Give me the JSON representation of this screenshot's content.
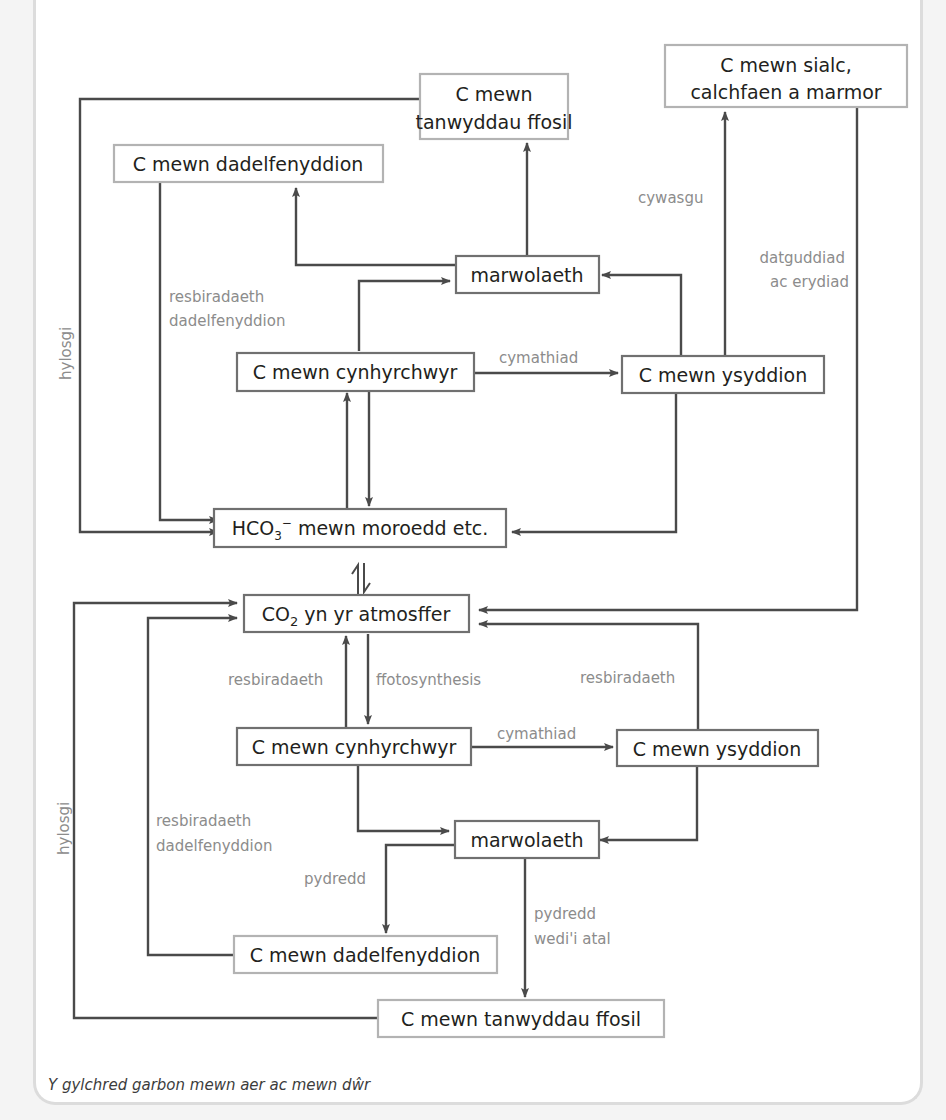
{
  "caption": "Y gylchred garbon mewn aer ac mewn dŵr",
  "colors": {
    "line": "#4a4a4a",
    "box_text": "#231f20",
    "label": "#8c8c8c",
    "grey_border": "#b3b3b3",
    "dark_border": "#707070"
  },
  "top": {
    "boxes": {
      "fossil_fuels_l1": "C mewn",
      "fossil_fuels_l2": "tanwyddau ffosil",
      "chalk_l1": "C mewn sialc,",
      "chalk_l2": "calchfaen a marmor",
      "decomposers": "C mewn dadelfenyddion",
      "death": "marwolaeth",
      "producers": "C mewn cynhyrchwyr",
      "consumers": "C mewn ysyddion",
      "bicarbonate_prefix": "HCO",
      "bicarbonate_sub": "3",
      "bicarbonate_sup": "−",
      "bicarbonate_rest": " mewn moroedd etc."
    },
    "labels": {
      "combustion": "hylosgi",
      "decomp_resp_l1": "resbiradaeth",
      "decomp_resp_l2": "dadelfenyddion",
      "compression": "cywasgu",
      "exposure_l1": "datguddiad",
      "exposure_l2": "ac erydiad",
      "assimilation": "cymathiad"
    }
  },
  "bottom": {
    "boxes": {
      "atmosphere_prefix": "CO",
      "atmosphere_sub": "2",
      "atmosphere_rest": " yn yr atmosffer",
      "producers": "C mewn cynhyrchwyr",
      "consumers": "C mewn ysyddion",
      "death": "marwolaeth",
      "decomposers": "C mewn dadelfenyddion",
      "fossil_fuels": "C mewn tanwyddau ffosil"
    },
    "labels": {
      "respiration_left": "resbiradaeth",
      "photosynthesis": "ffotosynthesis",
      "respiration_right": "resbiradaeth",
      "assimilation": "cymathiad",
      "combustion": "hylosgi",
      "decomp_resp_l1": "resbiradaeth",
      "decomp_resp_l2": "dadelfenyddion",
      "decay": "pydredd",
      "decay_stopped_l1": "pydredd",
      "decay_stopped_l2": "wedi'i atal"
    }
  }
}
